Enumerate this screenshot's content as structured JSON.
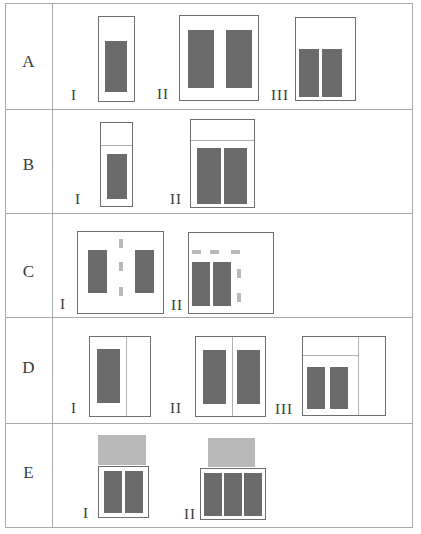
{
  "rows": [
    {
      "label": "A",
      "variants": [
        "I",
        "II",
        "III"
      ]
    },
    {
      "label": "B",
      "variants": [
        "I",
        "II"
      ]
    },
    {
      "label": "C",
      "variants": [
        "I",
        "II"
      ]
    },
    {
      "label": "D",
      "variants": [
        "I",
        "II",
        "III"
      ]
    },
    {
      "label": "E",
      "variants": [
        "I",
        "II"
      ]
    }
  ],
  "colors": {
    "table_border": "#a9a9a9",
    "frame_border": "#6e6e6e",
    "panel_dark": "#6b6b6b",
    "panel_light": "#b9b9b9",
    "divider": "#b0b0b0"
  }
}
